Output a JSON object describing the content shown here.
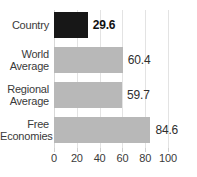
{
  "chart_data": {
    "type": "bar",
    "orientation": "horizontal",
    "title": "",
    "xlabel": "",
    "ylabel": "",
    "xlim": [
      0,
      100
    ],
    "grid": true,
    "legend": "none",
    "categories": [
      "Country",
      "World Average",
      "Regional Average",
      "Free Economies"
    ],
    "values": [
      29.6,
      60.4,
      59.7,
      84.6
    ],
    "value_labels": [
      "29.6",
      "60.4",
      "59.7",
      "84.6"
    ],
    "xticks": [
      0,
      20,
      40,
      60,
      80,
      100
    ],
    "xtick_labels": [
      "0",
      "20",
      "40",
      "60",
      "80",
      "100"
    ],
    "bars": [
      {
        "label_lines": [
          "Country"
        ],
        "value": 29.6,
        "value_label": "29.6",
        "color": "#171717",
        "emphasis": true
      },
      {
        "label_lines": [
          "World",
          "Average"
        ],
        "value": 60.4,
        "value_label": "60.4",
        "color": "#b8b8b8",
        "emphasis": false
      },
      {
        "label_lines": [
          "Regional",
          "Average"
        ],
        "value": 59.7,
        "value_label": "59.7",
        "color": "#b8b8b8",
        "emphasis": false
      },
      {
        "label_lines": [
          "Free",
          "Economies"
        ],
        "value": 84.6,
        "value_label": "84.6",
        "color": "#b8b8b8",
        "emphasis": false
      }
    ]
  },
  "colors": {
    "country_bar": "#171717",
    "reference_bar": "#b8b8b8",
    "gridline": "#e3e3e3",
    "text": "#3a3a3a",
    "background": "#ffffff"
  }
}
